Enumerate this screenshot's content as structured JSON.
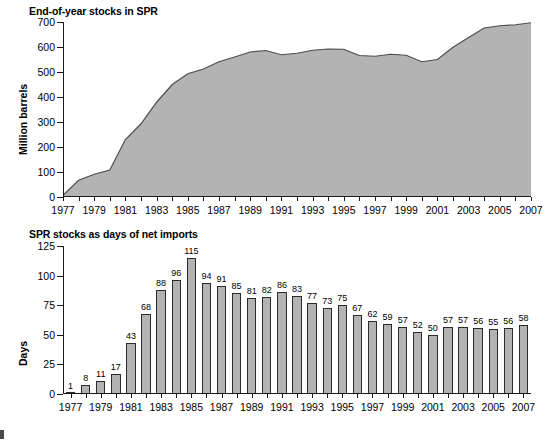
{
  "figure": {
    "background": "#ffffff",
    "series_fill": "#b3b3b3",
    "series_stroke": "#4d4d4d",
    "bar_fill": "#b3b3b3",
    "bar_stroke": "#2b2b2b"
  },
  "chart_data": [
    {
      "type": "area",
      "title": "End-of-year stocks in SPR",
      "xlabel": "",
      "ylabel": "Million barrels",
      "ylim": [
        0,
        700
      ],
      "yticks": [
        0,
        100,
        200,
        300,
        400,
        500,
        600,
        700
      ],
      "xlim": [
        1977,
        2007
      ],
      "xticks": [
        1977,
        1979,
        1981,
        1983,
        1985,
        1987,
        1989,
        1991,
        1993,
        1995,
        1997,
        1999,
        2001,
        2003,
        2005,
        2007
      ],
      "grid": false,
      "legend": "none",
      "x": [
        1977,
        1978,
        1979,
        1980,
        1981,
        1982,
        1983,
        1984,
        1985,
        1986,
        1987,
        1988,
        1989,
        1990,
        1991,
        1992,
        1993,
        1994,
        1995,
        1996,
        1997,
        1998,
        1999,
        2000,
        2001,
        2002,
        2003,
        2004,
        2005,
        2006,
        2007
      ],
      "values": [
        7,
        67,
        91,
        108,
        230,
        293,
        379,
        450,
        493,
        512,
        541,
        560,
        580,
        586,
        569,
        575,
        587,
        592,
        591,
        566,
        563,
        571,
        567,
        541,
        550,
        599,
        638,
        676,
        685,
        689,
        697
      ]
    },
    {
      "type": "bar",
      "title": "SPR stocks as days of net imports",
      "xlabel": "",
      "ylabel": "Days",
      "ylim": [
        0,
        125
      ],
      "yticks": [
        0,
        25,
        50,
        75,
        100,
        125
      ],
      "grid": false,
      "legend": "none",
      "categories": [
        "1977",
        "1978",
        "1979",
        "1980",
        "1981",
        "1982",
        "1983",
        "1984",
        "1985",
        "1986",
        "1987",
        "1988",
        "1989",
        "1990",
        "1991",
        "1992",
        "1993",
        "1994",
        "1995",
        "1996",
        "1997",
        "1998",
        "1999",
        "2000",
        "2001",
        "2002",
        "2003",
        "2004",
        "2005",
        "2006",
        "2007"
      ],
      "tick_labels": [
        "1977",
        "",
        "1979",
        "",
        "1981",
        "",
        "1983",
        "",
        "1985",
        "",
        "1987",
        "",
        "1989",
        "",
        "1991",
        "",
        "1993",
        "",
        "1995",
        "",
        "1997",
        "",
        "1999",
        "",
        "2001",
        "",
        "2003",
        "",
        "2005",
        "",
        "2007"
      ],
      "values": [
        1,
        8,
        11,
        17,
        43,
        68,
        88,
        96,
        115,
        94,
        91,
        85,
        81,
        82,
        86,
        83,
        77,
        73,
        75,
        67,
        62,
        59,
        57,
        52,
        50,
        57,
        57,
        56,
        55,
        56,
        58
      ],
      "data_labels": [
        "1",
        "8",
        "11",
        "17",
        "43",
        "68",
        "88",
        "96",
        "115",
        "94",
        "91",
        "85",
        "81",
        "82",
        "86",
        "83",
        "77",
        "73",
        "75",
        "67",
        "62",
        "59",
        "57",
        "52",
        "50",
        "57",
        "57",
        "56",
        "55",
        "56",
        "58"
      ]
    }
  ]
}
